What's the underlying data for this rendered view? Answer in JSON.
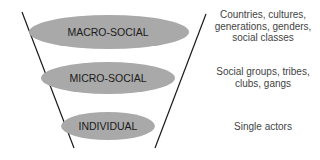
{
  "diagram": {
    "type": "funnel",
    "colors": {
      "ellipse_fill": "#a9a9a9",
      "line": "#1a1a1a",
      "label_text": "#1a1a1a",
      "description_text": "#444444"
    },
    "levels": [
      {
        "label": "MACRO-SOCIAL",
        "description_lines": [
          "Countries, cultures,",
          "generations, genders,",
          "social classes"
        ]
      },
      {
        "label": "MICRO-SOCIAL",
        "description_lines": [
          "Social groups, tribes,",
          "clubs, gangs"
        ]
      },
      {
        "label": "INDIVIDUAL",
        "description_lines": [
          "Single actors"
        ]
      }
    ]
  }
}
